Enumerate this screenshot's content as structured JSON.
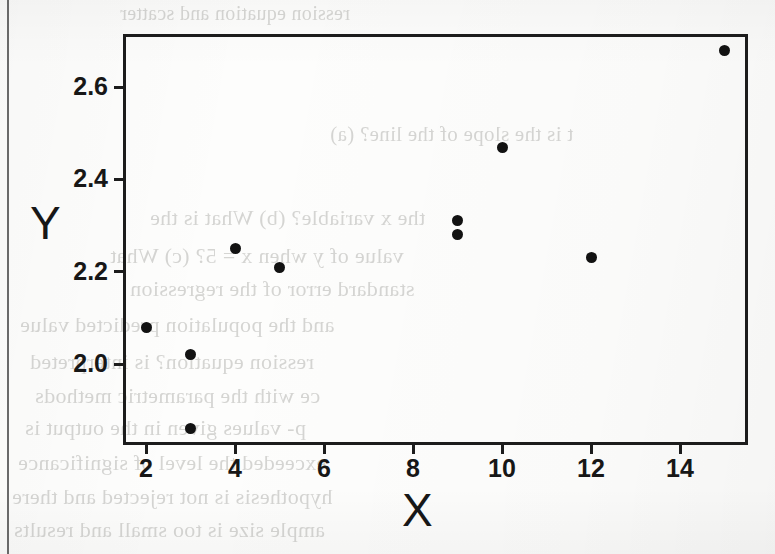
{
  "page": {
    "kind": "scanned-page-scatter-plot",
    "background_ghost_text": [
      "ression equation and scatter",
      "t is the slope of the line? (a)",
      "the x variable? (b) What is the",
      "value of y when x = 5? (c) What",
      "standard error of the regression",
      "and the population predicted value",
      "ression equation? is interpreted",
      "ce with the parametric methods",
      "p- values given in the output is",
      "exceeded the level of significance",
      "hypothesis is not rejected and there",
      "ample size is too small and results"
    ]
  },
  "chart_data": {
    "type": "scatter",
    "title": "",
    "xlabel": "X",
    "ylabel": "Y",
    "xlim": [
      1.5,
      15.5
    ],
    "ylim": [
      1.83,
      2.72
    ],
    "xticks": [
      2,
      4,
      6,
      8,
      10,
      12,
      14
    ],
    "xticklabels": [
      "2",
      "4",
      "6",
      "8",
      "10",
      "12",
      "14"
    ],
    "yticks": [
      2.0,
      2.2,
      2.4,
      2.6
    ],
    "yticklabels": [
      "2.0",
      "2.2",
      "2.4",
      "2.6"
    ],
    "grid": false,
    "legend": false,
    "marker": "filled-circle",
    "marker_color": "#121212",
    "marker_size": 11,
    "n_points": 10,
    "x": [
      2,
      3,
      3,
      4,
      5,
      9,
      9,
      10,
      12,
      15
    ],
    "y": [
      2.08,
      2.02,
      1.86,
      2.25,
      2.21,
      2.31,
      2.28,
      2.47,
      2.23,
      2.68
    ],
    "points": [
      {
        "x": 2,
        "y": 2.08
      },
      {
        "x": 3,
        "y": 2.02
      },
      {
        "x": 3,
        "y": 1.86
      },
      {
        "x": 4,
        "y": 2.25
      },
      {
        "x": 5,
        "y": 2.21
      },
      {
        "x": 9,
        "y": 2.31
      },
      {
        "x": 9,
        "y": 2.28
      },
      {
        "x": 10,
        "y": 2.47
      },
      {
        "x": 12,
        "y": 2.23
      },
      {
        "x": 15,
        "y": 2.68
      }
    ]
  },
  "colors": {
    "axis": "#1c1c1c",
    "text": "#171717",
    "marker": "#121212",
    "paper": "#fdfdfc"
  }
}
